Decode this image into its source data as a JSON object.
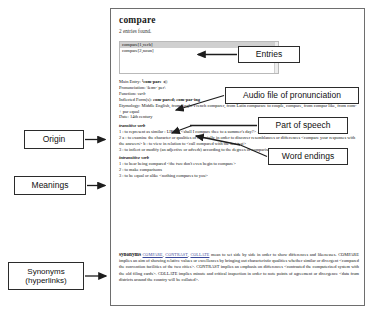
{
  "dictionary": {
    "headword": "compare",
    "results_note": "2 entries found.",
    "entry_list": [
      "compare[1,verb]",
      "compare[2,noun]"
    ],
    "fields": {
      "main_entry_label": "Main Entry:",
      "main_entry_value": "¹com·pare",
      "speaker_glyph": "◂))",
      "pronunciation_label": "Pronunciation:",
      "pronunciation_value": "\\kəm-ˈper\\",
      "function_label": "Function:",
      "function_value": "verb",
      "inflected_label": "Inflected Form(s):",
      "inflected_value": "com·pared; com·par·ing",
      "etymology_label": "Etymology:",
      "etymology_value": "Middle English, from Anglo-French comparer, from Latin comparare to couple, compare, from compar like, from com- + par equal",
      "date_label": "Date:",
      "date_value": "14th century"
    },
    "transitive_label": "transitive verb",
    "transitive_senses": [
      "1 : to represent as similar : LIKEN <shall I compare thee to a summer's day?> — Shakespeare>",
      "2 a : to examine the character or qualities of especially in order to discover resemblances or differences <compare your responses with the answers> b : to view in relation to <call compared with the last test>",
      "3 : to inflect or modify (an adjective or adverb) according to the degrees of comparison"
    ],
    "intransitive_label": "intransitive verb",
    "intransitive_senses": [
      "1 : to bear being compared <the two don't even begin to compare>",
      "2 : to make comparisons",
      "3 : to be equal or alike <nothing compares to you>"
    ],
    "synonyms_heading": "synonyms",
    "synonym_links": [
      "COMPARE",
      "CONTRAST",
      "COLLATE"
    ],
    "synonyms_body": "mean to set side by side in order to show differences and likenesses. COMPARE implies an aim of showing relative values or excellences by bringing out characteristic qualities whether similar or divergent <compared the convention facilities of the two cities>. CONTRAST implies an emphasis on differences <contrasted the computerized system with the old filing cards>. COLLATE implies minute and critical inspection in order to note points of agreement or divergence <data from districts around the country will be collated>."
  },
  "annotations": {
    "right": [
      {
        "label": "Entries"
      },
      {
        "label": "Audio file of pronunciation"
      },
      {
        "label": "Part of speech"
      },
      {
        "label": "Word endings"
      }
    ],
    "left": [
      {
        "label": "Origin"
      },
      {
        "label": "Meanings"
      },
      {
        "label_line1": "Synonyms",
        "label_line2": "(hyperlinks)"
      }
    ]
  },
  "colors": {
    "frame_border": "#6e6e6e",
    "callout_border": "#2b2b2b",
    "selection": "#d0d0d0",
    "hyperlink": "#3b4a9b"
  }
}
